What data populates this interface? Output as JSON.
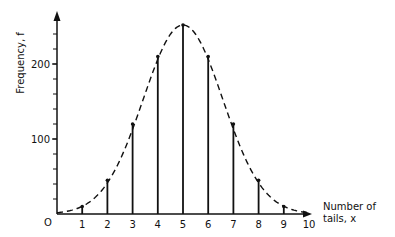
{
  "chart_data": {
    "type": "bar",
    "subtype": "stem-with-curve",
    "title": "",
    "xlabel": "Number of tails, x",
    "xlabel_lines": [
      "Number of",
      "tails, x"
    ],
    "ylabel": "Frequency, f",
    "origin_label": "O",
    "categories": [
      0,
      1,
      2,
      3,
      4,
      5,
      6,
      7,
      8,
      9,
      10
    ],
    "x_tick_labels": [
      "1",
      "2",
      "3",
      "4",
      "5",
      "6",
      "7",
      "8",
      "9",
      "10"
    ],
    "y_tick_labels": [
      {
        "value": 100,
        "label": "100"
      },
      {
        "value": 200,
        "label": "200"
      }
    ],
    "y_minor_tick_step": 20,
    "values": [
      1,
      10,
      45,
      120,
      210,
      252,
      210,
      120,
      45,
      10,
      1
    ],
    "series": [
      {
        "name": "Frequency (stems)",
        "values": [
          1,
          10,
          45,
          120,
          210,
          252,
          210,
          120,
          45,
          10,
          1
        ]
      },
      {
        "name": "Normal curve (dashed)",
        "style": "dashed",
        "mean": 5,
        "sd": 1.58
      }
    ],
    "xlim": [
      0,
      10.6
    ],
    "ylim": [
      0,
      270
    ],
    "grid": false,
    "legend": "none"
  }
}
